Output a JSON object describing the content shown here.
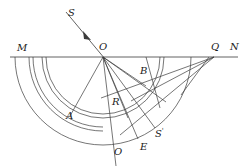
{
  "figure": {
    "type": "optics-ray-geometry-diagram",
    "canvas": {
      "width": 246,
      "height": 166
    },
    "stroke_color": "#3b3b3b",
    "line_width": 0.7,
    "background": "#ffffff"
  },
  "labels": {
    "M": "M",
    "N": "N",
    "O_center": "O",
    "Q_top": "Q",
    "S_incident": "S",
    "A": "A",
    "B": "B",
    "R": "R",
    "E": "E",
    "O_bottom": "O",
    "S_prime": "S",
    "S_prime_mark": "'"
  },
  "geometry": {
    "interface_line": {
      "name": "MN",
      "x1": 10,
      "y1": 57,
      "x2": 238,
      "y2": 57
    },
    "center": {
      "name": "O",
      "x": 103,
      "y": 57
    },
    "q_point": {
      "name": "Q",
      "x": 214,
      "y": 57
    },
    "arcs": [
      {
        "name": "outer-semicircle",
        "cx": 103,
        "cy": 57,
        "r": 88
      },
      {
        "name": "middle-arc",
        "cx": 103,
        "cy": 57,
        "r": 61
      },
      {
        "name": "inner-arc",
        "cx": 103,
        "cy": 57,
        "r": 57
      },
      {
        "name": "right-arc-outer",
        "cx": 103,
        "cy": 57,
        "r": 74
      },
      {
        "name": "right-arc-inner",
        "cx": 103,
        "cy": 57,
        "r": 70
      }
    ],
    "incident_ray": {
      "name": "S-to-O",
      "x1": 68,
      "y1": 14,
      "x2": 103,
      "y2": 57
    },
    "arrow_head": {
      "x": 86,
      "y": 36
    },
    "rays_from_O": [
      {
        "name": "ray-OA",
        "x2": 71,
        "y2": 113
      },
      {
        "name": "ray-OR",
        "x2": 121,
        "y2": 105
      },
      {
        "name": "ray-OB",
        "x2": 145,
        "y2": 85
      },
      {
        "name": "ray-O-bottom",
        "x2": 117,
        "y2": 145
      },
      {
        "name": "ray-OE",
        "x2": 139,
        "y2": 140
      },
      {
        "name": "ray-OS-prime",
        "x2": 156,
        "y2": 130
      },
      {
        "name": "ray-O-to-far",
        "x2": 163,
        "y2": 100
      }
    ],
    "rays_from_Q": [
      {
        "name": "ray-Q-to-R",
        "x2": 104,
        "y2": 99
      },
      {
        "name": "ray-Q-to-focus",
        "x2": 133,
        "y2": 101
      },
      {
        "name": "ray-Q-down",
        "x2": 122,
        "y2": 133
      }
    ]
  },
  "label_positions": {
    "M": {
      "x": 17,
      "y": 43
    },
    "N": {
      "x": 230,
      "y": 42
    },
    "O_center": {
      "x": 99,
      "y": 42
    },
    "Q_top": {
      "x": 211,
      "y": 42
    },
    "S_incident": {
      "x": 68,
      "y": 9
    },
    "A": {
      "x": 68,
      "y": 112
    },
    "B": {
      "x": 140,
      "y": 67
    },
    "R": {
      "x": 113,
      "y": 98
    },
    "E": {
      "x": 140,
      "y": 143
    },
    "O_bottom": {
      "x": 115,
      "y": 148
    },
    "S_prime": {
      "x": 156,
      "y": 130
    }
  }
}
